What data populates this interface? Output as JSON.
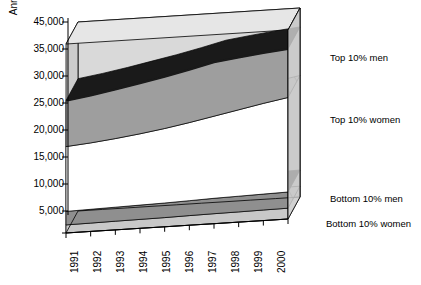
{
  "chart_data": {
    "type": "area",
    "title": "",
    "xlabel": "",
    "ylabel": "Annual earnings (£)",
    "categories": [
      "1991",
      "1992",
      "1993",
      "1994",
      "1995",
      "1996",
      "1997",
      "1998",
      "1999",
      "2000"
    ],
    "ytick_labels": [
      "45,000",
      "35,000",
      "30,000",
      "25,000",
      "20,000",
      "15,000",
      "10,000",
      "5,000"
    ],
    "ytick_values": [
      45000,
      35000,
      30000,
      25000,
      20000,
      15000,
      10000,
      5000
    ],
    "ylim": [
      5000,
      45000
    ],
    "grid": false,
    "legend_position": "right",
    "projection": "3d-stacked-area",
    "series": [
      {
        "name": "Top 10% men",
        "values": [
          29500,
          30200,
          31000,
          31900,
          32800,
          33800,
          34900,
          36000,
          37100,
          38000
        ]
      },
      {
        "name": "Top 10% women",
        "values": [
          21000,
          21400,
          21900,
          22500,
          23200,
          24000,
          24900,
          25800,
          26700,
          27500
        ]
      },
      {
        "name": "Bottom 10% men",
        "values": [
          9000,
          9100,
          9200,
          9300,
          9400,
          9550,
          9700,
          9800,
          9900,
          10000
        ]
      },
      {
        "name": "Bottom 10% women",
        "values": [
          6500,
          6550,
          6600,
          6650,
          6700,
          6780,
          6850,
          6900,
          6950,
          7000
        ]
      }
    ]
  },
  "colors": {
    "back_wall": "#d9d9d9",
    "side_wall": "#cccccc",
    "top_men_band": "#9e9e9e",
    "top_men_line": "#1a1a1a",
    "top_women_band": "#ffffff",
    "top_women_top": "#bdbdbd",
    "bottom_men_band": "#8f8f8f",
    "bottom_men_line": "#111111",
    "bottom_women_band": "#c8c8c8",
    "floor": "#d0d0d0",
    "outline": "#000000",
    "text": "#000000"
  },
  "labels": {
    "top_men": "Top 10% men",
    "top_women": "Top 10% women",
    "bottom_men": "Bottom 10% men",
    "bottom_women": "Bottom 10% women"
  }
}
